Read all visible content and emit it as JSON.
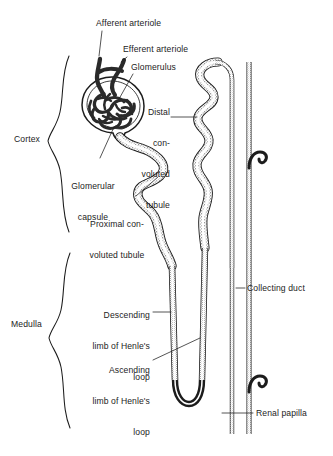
{
  "diagram": {
    "background_color": "#ffffff",
    "line_color": "#1c1c1c",
    "tubule_fill": "#f2f2f2",
    "vessel_color": "#2a2a2a"
  },
  "region_labels": [
    {
      "id": "cortex",
      "text": "Cortex",
      "x": 14,
      "y": 140
    },
    {
      "id": "medulla",
      "text": "Medulla",
      "x": 11,
      "y": 325
    }
  ],
  "labels": [
    {
      "id": "afferent-arteriole",
      "text": "Afferent arteriole",
      "x": 96,
      "y": 19,
      "width": 78,
      "align": "left"
    },
    {
      "id": "efferent-arteriole",
      "text": "Efferent arteriole",
      "x": 123,
      "y": 45,
      "width": 78,
      "align": "left"
    },
    {
      "id": "glomerulus",
      "text": "Glomerulus",
      "x": 131,
      "y": 63,
      "width": 60,
      "align": "left"
    },
    {
      "id": "distal-convoluted-tubule",
      "lines": [
        "Distal",
        "con-",
        "voluted",
        "tubule"
      ],
      "x": 140,
      "y": 87,
      "width": 46,
      "align": "right"
    },
    {
      "id": "glomerular-capsule",
      "lines": [
        "Glomerular",
        "capsule"
      ],
      "x": 60,
      "y": 161,
      "width": 66,
      "align": "center"
    },
    {
      "id": "proximal-convoluted-tubule",
      "lines": [
        "Proximal con-",
        "voluted tubule"
      ],
      "x": 80,
      "y": 199,
      "width": 72,
      "align": "center"
    },
    {
      "id": "descending-limb",
      "lines": [
        "Descending",
        "limb of Henle's",
        "loop"
      ],
      "x": 84,
      "y": 290,
      "width": 66,
      "align": "right"
    },
    {
      "id": "ascending-limb",
      "lines": [
        "Ascending",
        "limb of Henle's",
        "loop"
      ],
      "x": 78,
      "y": 345,
      "width": 72,
      "align": "right"
    },
    {
      "id": "collecting-duct",
      "text": "Collecting duct",
      "x": 247,
      "y": 284,
      "width": 80,
      "align": "left"
    },
    {
      "id": "renal-papilla",
      "text": "Renal papilla",
      "x": 256,
      "y": 409,
      "width": 72,
      "align": "left"
    }
  ]
}
